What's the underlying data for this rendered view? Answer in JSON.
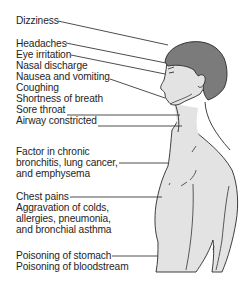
{
  "diagram": {
    "colors": {
      "hair": "#7a7a7a",
      "skin": "#e2e2e2",
      "outline": "#2a2a2a",
      "text": "#1e1e1e",
      "leader": "#3a3a3a"
    },
    "labels": [
      {
        "id": "dizziness",
        "lines": [
          "Dizziness"
        ]
      },
      {
        "id": "headaches",
        "lines": [
          "Headaches"
        ]
      },
      {
        "id": "eye-irritation",
        "lines": [
          "Eye irritation"
        ]
      },
      {
        "id": "nasal-discharge",
        "lines": [
          "Nasal discharge"
        ]
      },
      {
        "id": "nausea",
        "lines": [
          "Nausea and vomiting"
        ]
      },
      {
        "id": "coughing",
        "lines": [
          "Coughing"
        ]
      },
      {
        "id": "shortness-of-breath",
        "lines": [
          "Shortness of breath"
        ]
      },
      {
        "id": "sore-throat",
        "lines": [
          "Sore throat"
        ]
      },
      {
        "id": "airway",
        "lines": [
          "Airway constricted"
        ]
      },
      {
        "id": "chronic",
        "lines": [
          "Factor in chronic",
          "bronchitis, lung cancer,",
          "and emphysema"
        ]
      },
      {
        "id": "chest",
        "lines": [
          "Chest pains",
          "Aggravation of colds,",
          "allergies, pneumonia,",
          "and bronchial asthma"
        ]
      },
      {
        "id": "poisoning",
        "lines": [
          "Poisoning of stomach",
          "Poisoning of bloodstream"
        ]
      }
    ]
  }
}
